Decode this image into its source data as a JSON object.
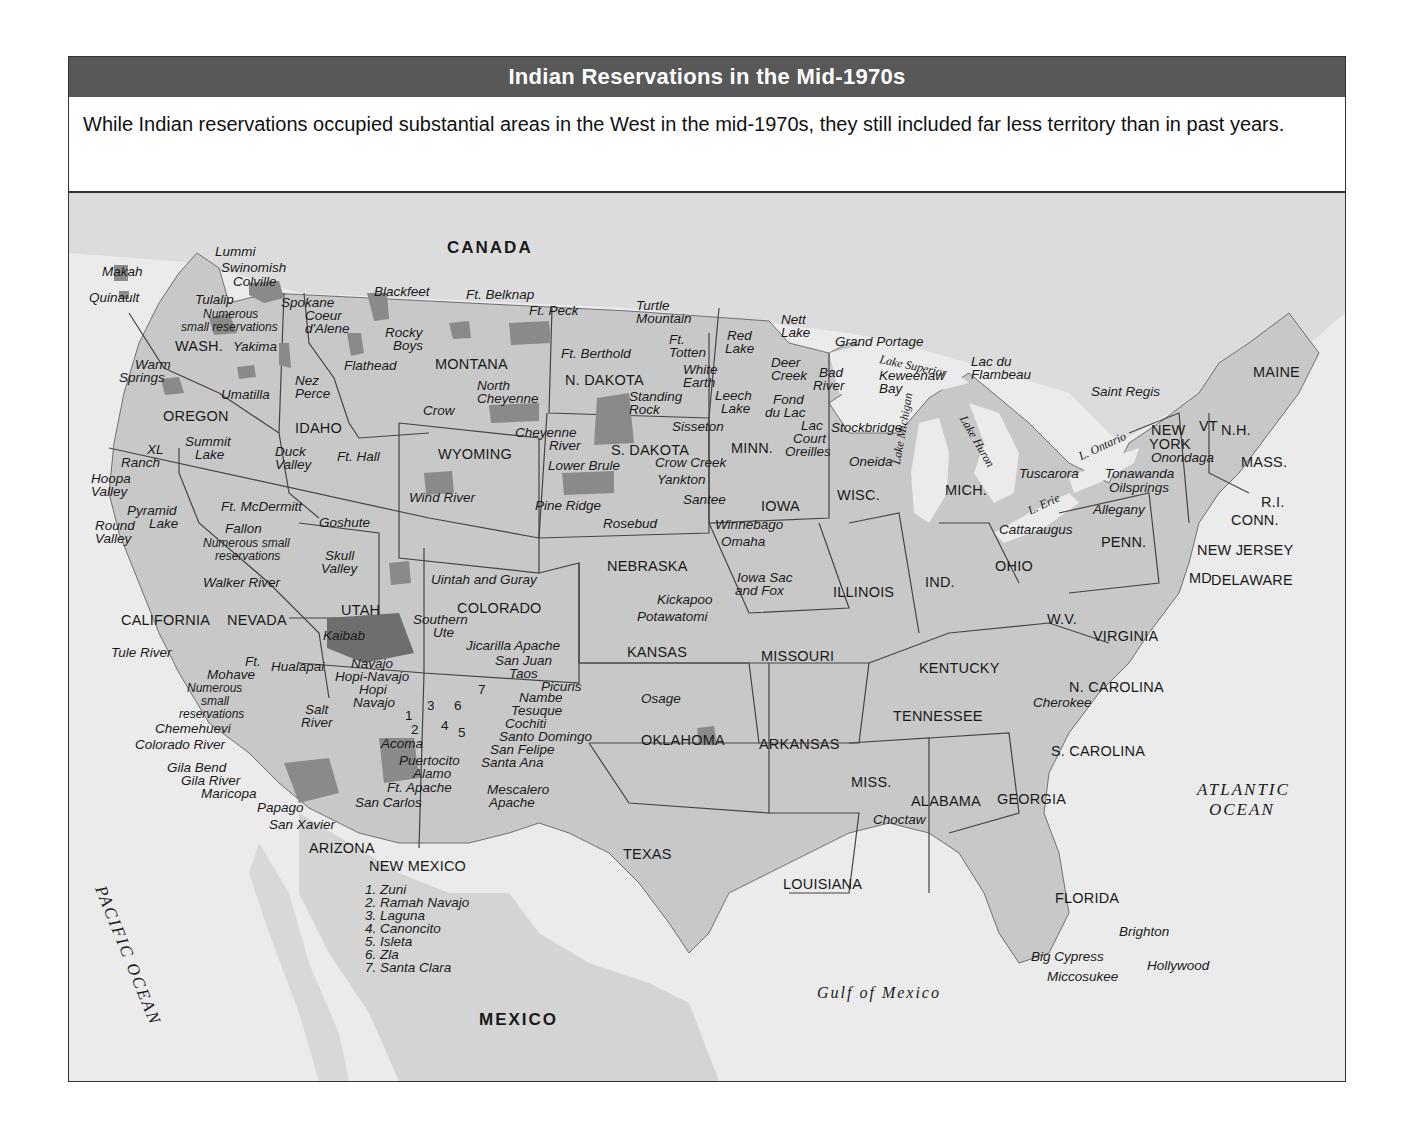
{
  "title": "Indian Reservations in the Mid-1970s",
  "caption": "While Indian reservations occupied substantial areas in the West in the mid-1970s, they still included far less territory than in past years.",
  "colors": {
    "title_bar": "#585858",
    "land": "#c8c8c8",
    "water": "#ebebeb",
    "reservation": "#8a8a8a",
    "large_reservation": "#6e6e6e",
    "border": "#444444"
  },
  "map": {
    "countries": {
      "canada": "CANADA",
      "mexico": "MEXICO"
    },
    "oceans": {
      "pacific": "PACIFIC OCEAN",
      "atlantic_1": "ATLANTIC",
      "atlantic_2": "OCEAN",
      "gulf": "Gulf of Mexico"
    },
    "lakes": {
      "superior": "Lake Superior",
      "michigan": "Lake Michigan",
      "huron": "Lake Huron",
      "erie": "L. Erie",
      "ontario": "L. Ontario"
    },
    "states": {
      "wash": "WASH.",
      "oregon": "OREGON",
      "california": "CALIFORNIA",
      "nevada": "NEVADA",
      "idaho": "IDAHO",
      "montana": "MONTANA",
      "wyoming": "WYOMING",
      "utah": "UTAH",
      "arizona": "ARIZONA",
      "colorado": "COLORADO",
      "new_mexico": "NEW MEXICO",
      "n_dakota": "N. DAKOTA",
      "s_dakota": "S. DAKOTA",
      "nebraska": "NEBRASKA",
      "kansas": "KANSAS",
      "oklahoma": "OKLAHOMA",
      "texas": "TEXAS",
      "minn": "MINN.",
      "iowa": "IOWA",
      "missouri": "MISSOURI",
      "arkansas": "ARKANSAS",
      "louisiana": "LOUISIANA",
      "wisc": "WISC.",
      "illinois": "ILLINOIS",
      "mich": "MICH.",
      "ind": "IND.",
      "ohio": "OHIO",
      "kentucky": "KENTUCKY",
      "tennessee": "TENNESSEE",
      "miss": "MISS.",
      "alabama": "ALABAMA",
      "georgia": "GEORGIA",
      "florida": "FLORIDA",
      "s_carolina": "S. CAROLINA",
      "n_carolina": "N. CAROLINA",
      "virginia": "VIRGINIA",
      "wv": "W.V.",
      "penn": "PENN.",
      "new_york_1": "NEW",
      "new_york_2": "YORK",
      "vt": "VT",
      "nh": "N.H.",
      "maine": "MAINE",
      "mass": "MASS.",
      "ri": "R.I.",
      "conn": "CONN.",
      "new_jersey": "NEW JERSEY",
      "md": "MD",
      "delaware": "DELAWARE"
    },
    "reservations": {
      "makah": "Makah",
      "lummi": "Lummi",
      "swinomish": "Swinomish",
      "colville": "Colville",
      "quinault": "Quinault",
      "tulalip": "Tulalip",
      "numerous_wa_1": "Numerous",
      "numerous_wa_2": "small reservations",
      "yakima": "Yakima",
      "spokane": "Spokane",
      "coeur_1": "Coeur",
      "coeur_2": "d'Alene",
      "blackfeet": "Blackfeet",
      "ft_belknap": "Ft. Belknap",
      "ft_peck": "Ft. Peck",
      "rocky_1": "Rocky",
      "rocky_2": "Boys",
      "flathead": "Flathead",
      "warm_1": "Warm",
      "warm_2": "Springs",
      "umatilla": "Umatilla",
      "nez_1": "Nez",
      "nez_2": "Perce",
      "crow": "Crow",
      "north_cheyenne_1": "North",
      "north_cheyenne_2": "Cheyenne",
      "turtle_1": "Turtle",
      "turtle_2": "Mountain",
      "ft_berthold": "Ft. Berthold",
      "ft_totten_1": "Ft.",
      "ft_totten_2": "Totten",
      "standing_1": "Standing",
      "standing_2": "Rock",
      "cheyenne_river_1": "Cheyenne",
      "cheyenne_river_2": "River",
      "sisseton": "Sisseton",
      "white_earth_1": "White",
      "white_earth_2": "Earth",
      "red_lake_1": "Red",
      "red_lake_2": "Lake",
      "nett_1": "Nett",
      "nett_2": "Lake",
      "leech_1": "Leech",
      "leech_2": "Lake",
      "deer_1": "Deer",
      "deer_2": "Creek",
      "fond_1": "Fond",
      "fond_2": "du Lac",
      "grand_portage": "Grand Portage",
      "bad_river_1": "Bad",
      "bad_river_2": "River",
      "keweenaw_1": "Keweenaw",
      "keweenaw_2": "Bay",
      "lac_du_1": "Lac du",
      "lac_du_2": "Flambeau",
      "lac_court_1": "Lac",
      "lac_court_2": "Court",
      "lac_court_3": "Oreilles",
      "stockbridge": "Stockbridge",
      "oneida": "Oneida",
      "summit_1": "Summit",
      "summit_2": "Lake",
      "xl_1": "XL",
      "xl_2": "Ranch",
      "hoopa_1": "Hoopa",
      "hoopa_2": "Valley",
      "duck_1": "Duck",
      "duck_2": "Valley",
      "ft_hall": "Ft. Hall",
      "ft_mcdermitt": "Ft. McDermitt",
      "pyramid_1": "Pyramid",
      "pyramid_2": "Lake",
      "round_1": "Round",
      "round_2": "Valley",
      "fallon": "Fallon",
      "numerous_nv_1": "Numerous small",
      "numerous_nv_2": "reservations",
      "goshute": "Goshute",
      "skull_1": "Skull",
      "skull_2": "Valley",
      "walker_river": "Walker River",
      "uintah": "Uintah and Guray",
      "wind_river": "Wind River",
      "lower_brule": "Lower Brule",
      "crow_creek": "Crow Creek",
      "yankton": "Yankton",
      "pine_ridge": "Pine Ridge",
      "rosebud": "Rosebud",
      "santee": "Santee",
      "winnebago": "Winnebago",
      "omaha": "Omaha",
      "iowa_sac_1": "Iowa Sac",
      "iowa_sac_2": "and Fox",
      "kickapoo": "Kickapoo",
      "potawatomi": "Potawatomi",
      "osage": "Osage",
      "tule_river": "Tule River",
      "kaibab": "Kaibab",
      "southern_ute_1": "Southern",
      "southern_ute_2": "Ute",
      "jicarilla": "Jicarilla Apache",
      "san_juan": "San Juan",
      "taos": "Taos",
      "picuris": "Picuris",
      "nambe": "Nambe",
      "tesuque": "Tesuque",
      "cochiti": "Cochiti",
      "santo_domingo": "Santo Domingo",
      "san_felipe": "San Felipe",
      "santa_ana": "Santa Ana",
      "ft_mohave_1": "Ft.",
      "ft_mohave_2": "Mohave",
      "hualapai": "Hualapai",
      "navajo_1": "Navajo",
      "hopi_navajo": "Hopi-Navajo",
      "hopi": "Hopi",
      "navajo_2": "Navajo",
      "numerous_az_1": "Numerous",
      "numerous_az_2": "small",
      "numerous_az_3": "reservations",
      "chemehuevi": "Chemehuevi",
      "colorado_river": "Colorado River",
      "salt_1": "Salt",
      "salt_2": "River",
      "gila_bend": "Gila Bend",
      "gila_river": "Gila River",
      "maricopa": "Maricopa",
      "papago": "Papago",
      "san_xavier": "San Xavier",
      "acoma": "Acoma",
      "puertocito": "Puertocito",
      "alamo": "Alamo",
      "ft_apache": "Ft. Apache",
      "san_carlos": "San Carlos",
      "mescalero_1": "Mescalero",
      "mescalero_2": "Apache",
      "cherokee": "Cherokee",
      "choctaw": "Choctaw",
      "brighton": "Brighton",
      "big_cypress": "Big Cypress",
      "hollywood": "Hollywood",
      "miccosukee": "Miccosukee",
      "saint_regis": "Saint Regis",
      "onondaga": "Onondaga",
      "tuscarora": "Tuscarora",
      "tonawanda": "Tonawanda",
      "oilsprings": "Oilsprings",
      "allegany": "Allegany",
      "cattaraugus": "Cattaraugus"
    },
    "nm_numbers": [
      "1",
      "2",
      "3",
      "4",
      "5",
      "6",
      "7"
    ],
    "nm_legend": [
      "1. Zuni",
      "2. Ramah Navajo",
      "3. Laguna",
      "4. Canoncito",
      "5. Isleta",
      "6. Zla",
      "7. Santa Clara"
    ]
  }
}
